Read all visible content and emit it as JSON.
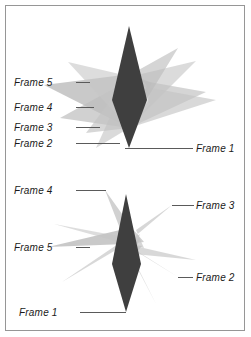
{
  "figure": {
    "name": "two-panel-overlapping-frames-diagram",
    "background_color": "#ffffff",
    "border_color": "#969696",
    "panels": [
      {
        "id": "top",
        "name": "top-panel",
        "labels": [
          {
            "id": "t-f5",
            "text": "Frame 5",
            "x": 14,
            "y": 77,
            "leader": {
              "x": 76,
              "y": 82,
              "width": 14
            }
          },
          {
            "id": "t-f4",
            "text": "Frame 4",
            "x": 14,
            "y": 102,
            "leader": {
              "x": 76,
              "y": 107,
              "width": 18
            }
          },
          {
            "id": "t-f3",
            "text": "Frame 3",
            "x": 14,
            "y": 122,
            "leader": {
              "x": 76,
              "y": 127,
              "width": 24
            }
          },
          {
            "id": "t-f2",
            "text": "Frame 2",
            "x": 14,
            "y": 138,
            "leader": {
              "x": 76,
              "y": 143,
              "width": 44
            }
          },
          {
            "id": "t-f1",
            "text": "Frame 1",
            "x": 196,
            "y": 143,
            "leader": {
              "x": 125,
              "y": 148,
              "width": 68
            }
          }
        ],
        "shapes": [
          {
            "id": "t-s5",
            "name": "frame-5-polygon",
            "fill": "#b4b4b4",
            "opacity": 0.72,
            "points": "129,128 44,85 131,74 152,83"
          },
          {
            "id": "t-s4",
            "name": "frame-4-polygon",
            "fill": "#bebebe",
            "opacity": 0.7,
            "points": "129,128 60,118 133,78 150,92"
          },
          {
            "id": "t-s3",
            "name": "frame-3-polygon",
            "fill": "#c4c4c4",
            "opacity": 0.68,
            "points": "129,128 86,133 132,72 148,88"
          },
          {
            "id": "t-s2",
            "name": "frame-2-polygon",
            "fill": "#c8c8c8",
            "opacity": 0.66,
            "points": "129,128 196,61 137,75 150,96"
          },
          {
            "id": "t-s6",
            "name": "frame-overlap-polygon-a",
            "fill": "#c0c0c0",
            "opacity": 0.66,
            "points": "129,128 206,92 138,80 149,100"
          },
          {
            "id": "t-s7",
            "name": "frame-overlap-polygon-b",
            "fill": "#c4c4c4",
            "opacity": 0.64,
            "points": "129,128 216,100 140,86 150,104"
          },
          {
            "id": "t-s8",
            "name": "frame-overlap-polygon-c",
            "fill": "#bcbcbc",
            "opacity": 0.62,
            "points": "129,128 178,48 135,72 147,86"
          },
          {
            "id": "t-s9",
            "name": "frame-overlap-polygon-d",
            "fill": "#c2c2c2",
            "opacity": 0.6,
            "points": "129,128 96,148 126,82 140,100"
          },
          {
            "id": "t-s10",
            "name": "frame-overlap-polygon-e",
            "fill": "#c6c6c6",
            "opacity": 0.6,
            "points": "129,128 68,62 128,76 144,88"
          },
          {
            "id": "t-s1",
            "name": "frame-1-polygon",
            "fill": "#3f3f3f",
            "opacity": 1,
            "points": "129,26 147,100 129,148 112,100"
          }
        ]
      },
      {
        "id": "bottom",
        "name": "bottom-panel",
        "labels": [
          {
            "id": "b-f4",
            "text": "Frame 4",
            "x": 14,
            "y": 17,
            "leader": {
              "x": 76,
              "y": 22,
              "width": 30
            }
          },
          {
            "id": "b-f3",
            "text": "Frame 3",
            "x": 196,
            "y": 32,
            "leader": {
              "x": 172,
              "y": 37,
              "width": 22
            }
          },
          {
            "id": "b-f5",
            "text": "Frame 5",
            "x": 14,
            "y": 74,
            "leader": {
              "x": 76,
              "y": 79,
              "width": 14
            }
          },
          {
            "id": "b-f2",
            "text": "Frame 2",
            "x": 196,
            "y": 104,
            "leader": {
              "x": 178,
              "y": 109,
              "width": 15
            }
          },
          {
            "id": "b-f1",
            "text": "Frame 1",
            "x": 19,
            "y": 139,
            "leader": {
              "x": 80,
              "y": 144,
              "width": 46
            }
          }
        ],
        "shapes": [
          {
            "id": "b-s4",
            "name": "frame-4-polygon",
            "fill": "#bebebe",
            "opacity": 0.7,
            "points": "126,76 105,22 132,60 144,74"
          },
          {
            "id": "b-s3",
            "name": "frame-3-polygon",
            "fill": "#c4c4c4",
            "opacity": 0.68,
            "points": "126,76 172,37 136,62 144,80"
          },
          {
            "id": "b-s5",
            "name": "frame-5-polygon",
            "fill": "#b4b4b4",
            "opacity": 0.72,
            "points": "126,76 48,79 120,62 134,72"
          },
          {
            "id": "b-s2",
            "name": "frame-2-polygon",
            "fill": "#c8c8c8",
            "opacity": 0.66,
            "points": "126,76 178,109 134,82 140,66"
          },
          {
            "id": "b-s6",
            "name": "frame-overlap-polygon-a",
            "fill": "#c2c2c2",
            "opacity": 0.64,
            "points": "126,76 196,92 134,86 140,70"
          },
          {
            "id": "b-s7",
            "name": "frame-overlap-polygon-b",
            "fill": "#c0c0c0",
            "opacity": 0.62,
            "points": "126,76 62,114 118,76 132,66"
          },
          {
            "id": "b-s8",
            "name": "frame-overlap-polygon-c",
            "fill": "#c6c6c6",
            "opacity": 0.62,
            "points": "126,76 96,136 120,88 136,82"
          },
          {
            "id": "b-s9",
            "name": "frame-overlap-polygon-d",
            "fill": "#bcbcbc",
            "opacity": 0.6,
            "points": "126,76 156,136 132,90 142,78"
          },
          {
            "id": "b-s10",
            "name": "frame-overlap-polygon-e",
            "fill": "#c4c4c4",
            "opacity": 0.58,
            "points": "126,76 54,56 118,68 132,60"
          },
          {
            "id": "b-s1",
            "name": "frame-1-polygon",
            "fill": "#3f3f3f",
            "opacity": 1,
            "points": "126,26 141,96 126,144 112,96"
          }
        ]
      }
    ]
  }
}
